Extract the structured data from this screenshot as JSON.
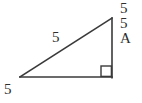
{
  "figure": {
    "kind": "right-triangle-diagram",
    "canvas": {
      "width": 142,
      "height": 103
    },
    "stroke_color": "#3a3a3a",
    "background_color": "#ffffff",
    "text_color": "#2e2e2e"
  },
  "labels": {
    "side_right_top": "5",
    "side_right_middle": "5",
    "angle_a": "A",
    "hypotenuse": "5",
    "base": "5"
  },
  "geometry": {
    "vertices": {
      "left": {
        "x": 20,
        "y": 77
      },
      "bottom_right": {
        "x": 112,
        "y": 77
      },
      "top_right": {
        "x": 112,
        "y": 18
      }
    },
    "right_angle_marker": {
      "x": 101,
      "y": 66,
      "size": 10,
      "at_vertex": "bottom_right"
    }
  }
}
